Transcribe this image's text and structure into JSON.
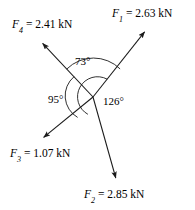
{
  "figure": {
    "background_color": "#ffffff",
    "stroke_color": "#1a1a1a",
    "text_color": "#000000",
    "origin": {
      "x": 93,
      "y": 97
    }
  },
  "forces": [
    {
      "id": "F1",
      "symbol": "F",
      "subscript": "1",
      "equals": " = ",
      "magnitude": "2.63",
      "unit": "kN",
      "label": "F1 = 2.63 kN",
      "tip": {
        "x": 146,
        "y": 30
      },
      "tail": {
        "x": 42,
        "y": 139
      }
    },
    {
      "id": "F2",
      "symbol": "F",
      "subscript": "2",
      "equals": " = ",
      "magnitude": "2.85",
      "unit": "kN",
      "label": "F2 = 2.85 kN",
      "tip": {
        "x": 117,
        "y": 180
      },
      "tail": {
        "x": 41,
        "y": 41
      }
    },
    {
      "id": "F3",
      "symbol": "F",
      "subscript": "3",
      "equals": " = ",
      "magnitude": "1.07",
      "unit": "kN",
      "label": "F3 = 1.07 kN",
      "tip": {
        "x": 42,
        "y": 139
      },
      "tail": {
        "x": 146,
        "y": 30
      }
    },
    {
      "id": "F4",
      "symbol": "F",
      "subscript": "4",
      "equals": " = ",
      "magnitude": "2.41",
      "unit": "kN",
      "label": "F4 = 2.41 kN",
      "tip": {
        "x": 41,
        "y": 41
      },
      "tail": {
        "x": 117,
        "y": 180
      }
    }
  ],
  "angles": [
    {
      "id": "a73",
      "value": "73",
      "unit": "°",
      "label": "73°",
      "between": "F4-F1",
      "position": "top"
    },
    {
      "id": "a95",
      "value": "95",
      "unit": "°",
      "label": "95°",
      "between": "F4-F3",
      "position": "left"
    },
    {
      "id": "a126",
      "value": "126",
      "unit": "°",
      "label": "126°",
      "between": "F1-F2",
      "position": "right"
    }
  ]
}
